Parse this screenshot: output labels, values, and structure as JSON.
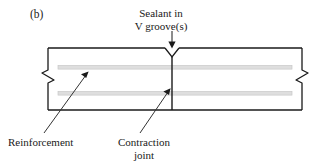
{
  "figure": {
    "panel_letter": "(b)",
    "caption_sealant_line1": "Sealant in",
    "caption_sealant_line2": "V groove(s)",
    "caption_reinforcement": "Reinforcement",
    "caption_contraction_line1": "Contraction",
    "caption_contraction_line2": "joint",
    "colors": {
      "outline": "#1a1a1a",
      "reinforcement_fill": "#dedede",
      "reinforcement_stroke": "#c8c8c8",
      "leader": "#333333",
      "background": "#ffffff"
    },
    "geometry": {
      "slab_left": 48,
      "slab_right": 302,
      "slab_top": 48,
      "slab_bottom": 110,
      "joint_x": 172,
      "bar_top_y": 67,
      "bar_bottom_y": 93,
      "bar_left": 58,
      "bar_right": 292,
      "v_groove_half_width": 7,
      "v_groove_depth": 9
    },
    "icons": {
      "break_symbol_left": "break-line-symbol",
      "break_symbol_right": "break-line-symbol",
      "v_groove": "v-notch-shape",
      "joint_line": "vertical-joint-line"
    }
  }
}
